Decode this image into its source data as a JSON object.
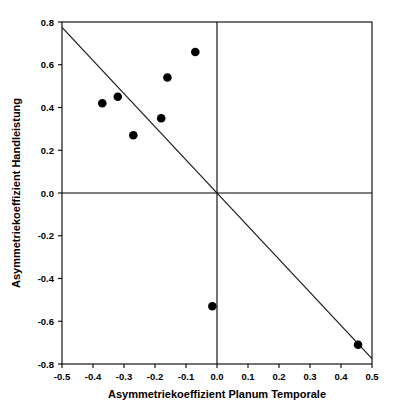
{
  "chart_data": {
    "type": "scatter",
    "title": "",
    "xlabel": "Asymmetriekoeffizient Planum Temporale",
    "ylabel": "Asymmetriekoeffizient Handleistung",
    "xlim": [
      -0.5,
      0.5
    ],
    "ylim": [
      -0.8,
      0.8
    ],
    "xticks": [
      -0.5,
      -0.4,
      -0.3,
      -0.2,
      -0.1,
      0.0,
      0.1,
      0.2,
      0.3,
      0.4,
      0.5
    ],
    "xtick_labels": [
      "-0.5",
      "-0.4",
      "-0.3",
      "-0.2",
      "-0.1",
      "0.0",
      "0.1",
      "0.2",
      "0.3",
      "0.4",
      "0.5"
    ],
    "yticks": [
      0.8,
      0.6,
      0.4,
      0.2,
      0.0,
      -0.2,
      -0.4,
      -0.6,
      -0.8
    ],
    "ytick_labels": [
      "0.8",
      "0.6",
      "0.4",
      "0.2",
      "0.0",
      "-0.2",
      "-0.4",
      "-0.6",
      "-0.8"
    ],
    "grid": false,
    "legend": null,
    "zero_lines": {
      "x": 0.0,
      "y": 0.0
    },
    "marker": {
      "shape": "circle",
      "color": "#000000",
      "size": 6
    },
    "points": [
      {
        "x": -0.37,
        "y": 0.42
      },
      {
        "x": -0.32,
        "y": 0.45
      },
      {
        "x": -0.27,
        "y": 0.27
      },
      {
        "x": -0.18,
        "y": 0.35
      },
      {
        "x": -0.16,
        "y": 0.54
      },
      {
        "x": -0.07,
        "y": 0.66
      },
      {
        "x": -0.015,
        "y": -0.53
      },
      {
        "x": 0.455,
        "y": -0.71
      }
    ],
    "series": [
      {
        "name": "Messwerte",
        "x": [
          -0.37,
          -0.32,
          -0.27,
          -0.18,
          -0.16,
          -0.07,
          -0.015,
          0.455
        ],
        "values": [
          0.42,
          0.45,
          0.27,
          0.35,
          0.54,
          0.66,
          -0.53,
          -0.71
        ]
      }
    ],
    "fit_line": {
      "type": "linear",
      "color": "#1a1a1a",
      "x_start": -0.5,
      "y_start": 0.775,
      "x_end": 0.5,
      "y_end": -0.775,
      "slope": -1.55,
      "intercept": 0.0
    }
  }
}
